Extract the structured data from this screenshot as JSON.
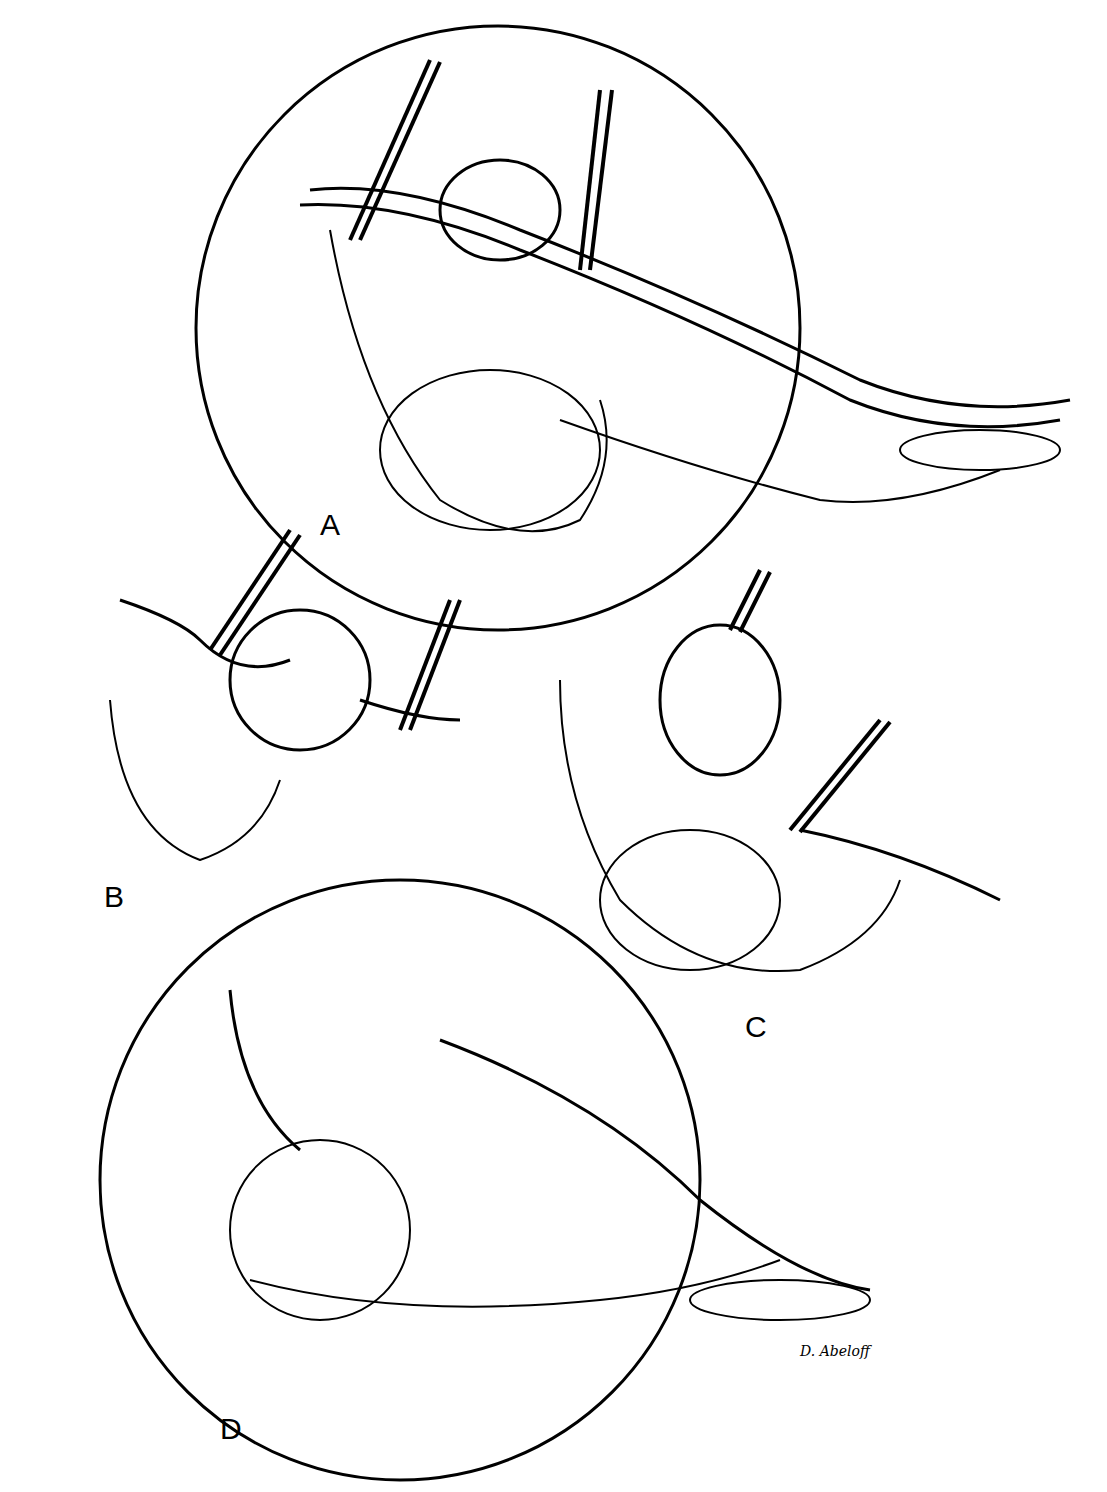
{
  "figure": {
    "type": "medical line illustration",
    "panels": [
      {
        "label": "A",
        "description": "Circular inset: mass on tube grasped by two forceps above mesentery-like tissue"
      },
      {
        "label": "B",
        "description": "Forceps dividing tube proximally; second forceps holding distal tube"
      },
      {
        "label": "C",
        "description": "Mass lifted away with forceps; distal division of tube"
      },
      {
        "label": "D",
        "description": "Circular inset: final result after removal of the mass"
      }
    ],
    "signature": "D. Abeloff",
    "colors": {
      "ink": "#000000",
      "background": "#ffffff"
    }
  }
}
